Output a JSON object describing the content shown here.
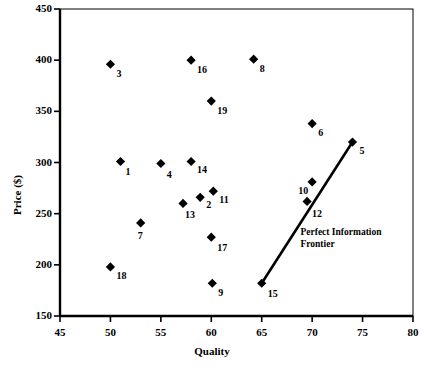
{
  "chart_data": {
    "type": "scatter",
    "title": "",
    "xlabel": "Quality",
    "ylabel": "Price ($)",
    "xlim": [
      45,
      80
    ],
    "ylim": [
      150,
      450
    ],
    "xticks": [
      45,
      50,
      55,
      60,
      65,
      70,
      75,
      80
    ],
    "yticks": [
      150,
      200,
      250,
      300,
      350,
      400,
      450
    ],
    "xtick_labels": [
      "45",
      "50",
      "55",
      "60",
      "65",
      "70",
      "75",
      "80"
    ],
    "ytick_labels": [
      "150",
      "200",
      "250",
      "300",
      "350",
      "400",
      "450"
    ],
    "grid": false,
    "legend": false,
    "marker": "diamond",
    "marker_color": "#000000",
    "points": [
      {
        "label": "3",
        "x": 50.0,
        "y": 396,
        "lx": 6,
        "ly": 5
      },
      {
        "label": "16",
        "x": 58.0,
        "y": 400,
        "lx": 6,
        "ly": 5
      },
      {
        "label": "8",
        "x": 64.2,
        "y": 401,
        "lx": 6,
        "ly": 5
      },
      {
        "label": "19",
        "x": 60.0,
        "y": 360,
        "lx": 6,
        "ly": 5
      },
      {
        "label": "6",
        "x": 70.0,
        "y": 338,
        "lx": 6,
        "ly": 4
      },
      {
        "label": "5",
        "x": 74.0,
        "y": 320,
        "lx": 7,
        "ly": 4
      },
      {
        "label": "1",
        "x": 51.0,
        "y": 301,
        "lx": 5,
        "ly": 6
      },
      {
        "label": "4",
        "x": 55.0,
        "y": 299,
        "lx": 6,
        "ly": 6
      },
      {
        "label": "14",
        "x": 58.0,
        "y": 301,
        "lx": 6,
        "ly": 4
      },
      {
        "label": "10",
        "x": 70.0,
        "y": 281,
        "lx": -14,
        "ly": 4
      },
      {
        "label": "11",
        "x": 60.2,
        "y": 272,
        "lx": 6,
        "ly": 4
      },
      {
        "label": "2",
        "x": 58.9,
        "y": 266,
        "lx": 6,
        "ly": 3
      },
      {
        "label": "12",
        "x": 69.5,
        "y": 262,
        "lx": 5,
        "ly": 8
      },
      {
        "label": "13",
        "x": 57.2,
        "y": 260,
        "lx": 2,
        "ly": 7
      },
      {
        "label": "7",
        "x": 53.0,
        "y": 241,
        "lx": -3,
        "ly": 8
      },
      {
        "label": "17",
        "x": 60.0,
        "y": 227,
        "lx": 6,
        "ly": 6
      },
      {
        "label": "18",
        "x": 50.0,
        "y": 198,
        "lx": 6,
        "ly": 4
      },
      {
        "label": "9",
        "x": 60.1,
        "y": 182,
        "lx": 6,
        "ly": 5
      },
      {
        "label": "15",
        "x": 65.0,
        "y": 182,
        "lx": 6,
        "ly": 6
      }
    ],
    "frontier_line": {
      "name": "Perfect Information Frontier",
      "annotation_lines": [
        "Perfect Information",
        "Frontier"
      ],
      "from": {
        "x": 65.0,
        "y": 182
      },
      "to": {
        "x": 74.0,
        "y": 320
      },
      "color": "#000000"
    },
    "axis_color": "#000000",
    "background_color": "#ffffff"
  }
}
